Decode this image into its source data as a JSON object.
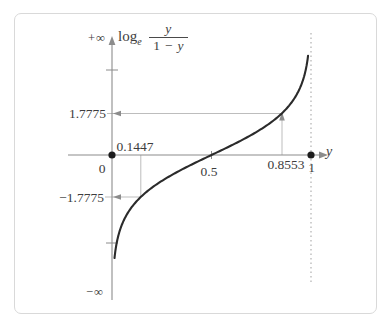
{
  "figure": {
    "title": {
      "operator": "log",
      "base": "e",
      "numerator": "y",
      "den_one": "1",
      "den_minus": "−",
      "den_var": "y"
    },
    "labels": {
      "plus_infinity": "+∞",
      "minus_infinity": "−∞",
      "pos_value": "1.7775",
      "neg_value": "−1.7775",
      "x_small": "0.1447",
      "x_mid": "0.5",
      "x_large": "0.8553",
      "origin_zero": "0",
      "one": "1",
      "x_axis_var": "y"
    },
    "colors": {
      "curve": "#2b2b2b",
      "axis": "#8c8c8c",
      "guide": "#bdbdbd",
      "dot": "#1c1c1c",
      "asymptote": "#a9a9a9",
      "text": "#3d3d3d",
      "frame": "#d9d9d9"
    }
  },
  "chart_data": {
    "type": "line",
    "xlabel": "y",
    "ylabel": "log_e( y / (1 − y) )",
    "function": "f(y) = ln( y / (1 - y) )  (logit)",
    "x_domain": [
      0,
      1
    ],
    "y_range": [
      "−∞",
      "+∞"
    ],
    "key_points": [
      {
        "y": 0.1447,
        "value": -1.7775
      },
      {
        "y": 0.5,
        "value": 0
      },
      {
        "y": 0.8553,
        "value": 1.7775
      }
    ],
    "marked_axis_points": [
      {
        "y": 0,
        "value": 0
      },
      {
        "y": 1,
        "value": 0
      }
    ],
    "asymptotes": [
      {
        "type": "vertical",
        "y": 0,
        "toward": "−∞"
      },
      {
        "type": "vertical",
        "y": 1,
        "toward": "+∞",
        "drawn_dashed": true
      }
    ],
    "grid": false,
    "legend": false
  }
}
